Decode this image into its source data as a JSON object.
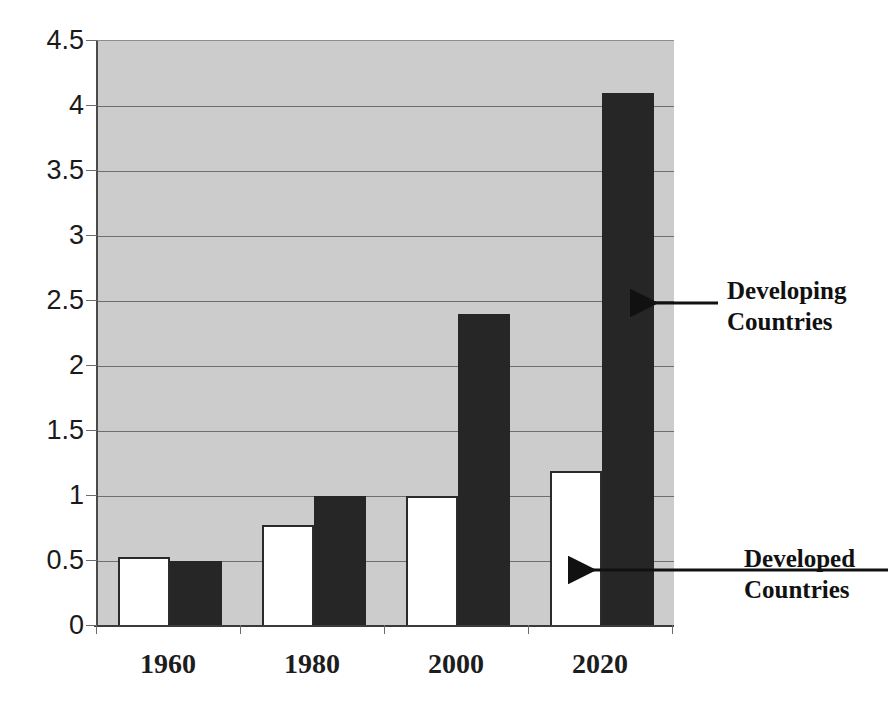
{
  "chart_data": {
    "type": "bar",
    "title": "",
    "subtitle": "",
    "xlabel": "",
    "ylabel": "",
    "categories": [
      "1960",
      "1980",
      "2000",
      "2020"
    ],
    "series": [
      {
        "name": "Developed Countries",
        "color": "#ffffff",
        "values": [
          0.53,
          0.78,
          1.0,
          1.19
        ]
      },
      {
        "name": "Developing Countries",
        "color": "#262626",
        "values": [
          0.5,
          1.0,
          2.4,
          4.1
        ]
      }
    ],
    "ylim": [
      0,
      4.5
    ],
    "yticks": [
      "4.5",
      "4",
      "3.5",
      "3",
      "2.5",
      "2",
      "1.5",
      "1",
      "0.5",
      "0"
    ],
    "ytick_values": [
      4.5,
      4,
      3.5,
      3,
      2.5,
      2,
      1.5,
      1,
      0.5,
      0
    ],
    "grid": true,
    "legend_position": "annotations",
    "plot_background": "#cccccc",
    "annotations": [
      {
        "id": "developing",
        "line1": "Developing",
        "line2": "Countries",
        "points_to": "black-bar-2020"
      },
      {
        "id": "developed",
        "line1": "Developed",
        "line2": "Countries",
        "points_to": "white-bar-2020"
      }
    ]
  },
  "annotations": {
    "developing": {
      "line1": "Developing",
      "line2": "Countries"
    },
    "developed": {
      "line1": "Developed",
      "line2": "Countries"
    }
  },
  "axis": {
    "y_ticks": [
      "4.5",
      "4",
      "3.5",
      "3",
      "2.5",
      "2",
      "1.5",
      "1",
      "0.5",
      "0"
    ],
    "x_ticks": [
      "1960",
      "1980",
      "2000",
      "2020"
    ]
  },
  "crop_artifact": {
    "text": ""
  }
}
